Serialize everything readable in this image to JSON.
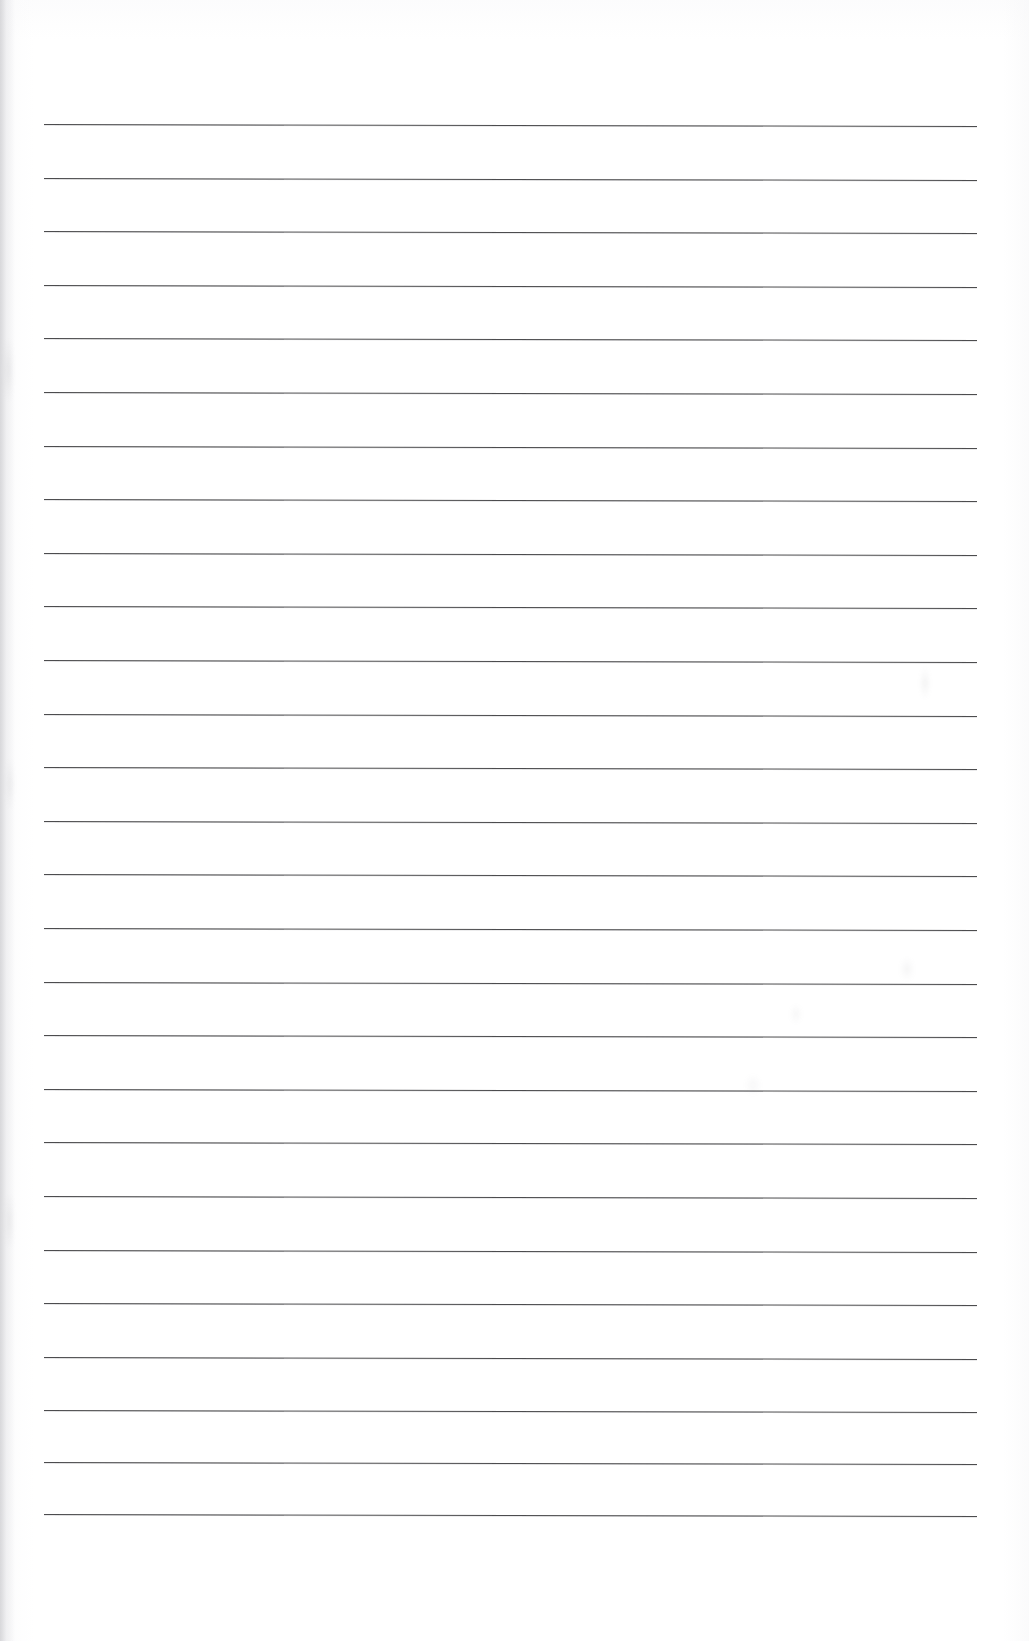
{
  "document": {
    "kind": "scanned-ruled-paper",
    "title": "Blank lined notebook page",
    "page_width": 1029,
    "page_height": 1641,
    "background_color": "#ffffff",
    "body_text": "",
    "has_handwriting": false,
    "has_margin_rule": false,
    "has_header": false,
    "has_page_number": false
  },
  "ruling": {
    "line_color": "#3d3d3f",
    "line_thickness_px": 1.4,
    "line_count": 27,
    "first_line_y": 124,
    "line_spacing_px": 53.6,
    "left_x": 44,
    "right_x": 977,
    "skew_deg": 0.12,
    "lines": [
      {
        "index": 1,
        "y": 124,
        "left": 44,
        "right": 977
      },
      {
        "index": 2,
        "y": 177.6,
        "left": 44,
        "right": 977
      },
      {
        "index": 3,
        "y": 231.2,
        "left": 44,
        "right": 977
      },
      {
        "index": 4,
        "y": 284.8,
        "left": 44,
        "right": 977
      },
      {
        "index": 5,
        "y": 338.4,
        "left": 44,
        "right": 977
      },
      {
        "index": 6,
        "y": 392.0,
        "left": 44,
        "right": 977
      },
      {
        "index": 7,
        "y": 445.6,
        "left": 44,
        "right": 977
      },
      {
        "index": 8,
        "y": 499.2,
        "left": 44,
        "right": 977
      },
      {
        "index": 9,
        "y": 552.8,
        "left": 44,
        "right": 977
      },
      {
        "index": 10,
        "y": 606.4,
        "left": 44,
        "right": 977
      },
      {
        "index": 11,
        "y": 660.0,
        "left": 44,
        "right": 977
      },
      {
        "index": 12,
        "y": 713.6,
        "left": 44,
        "right": 977
      },
      {
        "index": 13,
        "y": 767.2,
        "left": 44,
        "right": 977
      },
      {
        "index": 14,
        "y": 820.8,
        "left": 44,
        "right": 977
      },
      {
        "index": 15,
        "y": 874.4,
        "left": 44,
        "right": 977
      },
      {
        "index": 16,
        "y": 928.0,
        "left": 44,
        "right": 977
      },
      {
        "index": 17,
        "y": 981.6,
        "left": 44,
        "right": 977
      },
      {
        "index": 18,
        "y": 1035.2,
        "left": 44,
        "right": 977
      },
      {
        "index": 19,
        "y": 1088.8,
        "left": 44,
        "right": 977
      },
      {
        "index": 20,
        "y": 1142.4,
        "left": 44,
        "right": 977
      },
      {
        "index": 21,
        "y": 1196.0,
        "left": 44,
        "right": 977
      },
      {
        "index": 22,
        "y": 1249.6,
        "left": 44,
        "right": 977
      },
      {
        "index": 23,
        "y": 1303.2,
        "left": 44,
        "right": 977
      },
      {
        "index": 24,
        "y": 1356.8,
        "left": 44,
        "right": 977
      },
      {
        "index": 25,
        "y": 1410.4,
        "left": 44,
        "right": 977
      },
      {
        "index": 26,
        "y": 1462.0,
        "left": 44,
        "right": 977
      },
      {
        "index": 27,
        "y": 1514.0,
        "left": 44,
        "right": 977
      }
    ]
  },
  "artifacts": {
    "left_scan_shadow_color": "#cdcdd0",
    "smudges": [
      {
        "name": "smudge-upper-right",
        "x": 920,
        "y": 668,
        "w": 10,
        "h": 30,
        "opacity": 0.1
      },
      {
        "name": "smudge-mid-right",
        "x": 900,
        "y": 958,
        "w": 14,
        "h": 22,
        "opacity": 0.08
      },
      {
        "name": "smudge-mid-right-2",
        "x": 790,
        "y": 1005,
        "w": 12,
        "h": 18,
        "opacity": 0.07
      },
      {
        "name": "smudge-lower-right",
        "x": 745,
        "y": 1075,
        "w": 16,
        "h": 20,
        "opacity": 0.06
      },
      {
        "name": "smudge-left-edge",
        "x": 4,
        "y": 340,
        "w": 9,
        "h": 60,
        "opacity": 0.12
      },
      {
        "name": "smudge-left-edge-2",
        "x": 6,
        "y": 760,
        "w": 8,
        "h": 48,
        "opacity": 0.1
      },
      {
        "name": "smudge-left-edge-3",
        "x": 5,
        "y": 1195,
        "w": 9,
        "h": 52,
        "opacity": 0.1
      }
    ]
  }
}
